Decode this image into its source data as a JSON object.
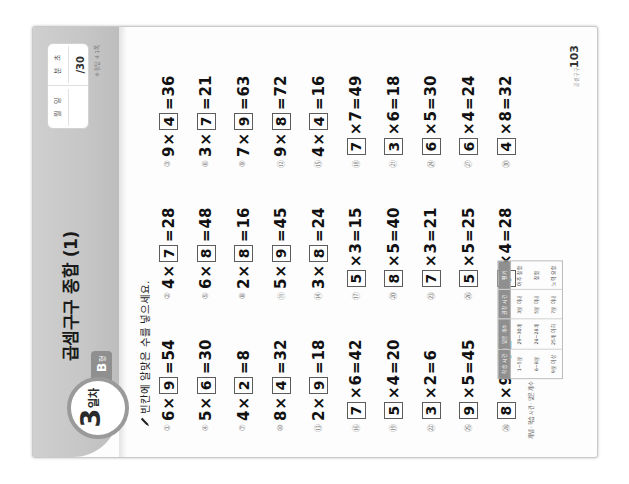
{
  "sheet": {
    "title": "곱셈구구 종합 (1)",
    "day_number": "3",
    "day_unit": "일차",
    "form_letter": "B",
    "form_unit": "형",
    "instruction": "빈칸에 알맞은 수를 넣으세요.",
    "page_number": "103",
    "brand": "곱셈구구",
    "score_box": {
      "label_month": "월",
      "label_day": "일",
      "label_minute": "분",
      "label_second": "초",
      "total": "/30",
      "caption": "※ 정답 4 1쪽"
    },
    "footer_table": {
      "label": "개념 · 학습 시간 · 맞은 개수",
      "headers": [
        "학습 시간",
        "맞은 개수",
        "권장 시간",
        "평가"
      ],
      "rows": [
        [
          "1~5분",
          "29~30개",
          "3분 이내",
          "아주 잘함"
        ],
        [
          "6~8분",
          "26~28개",
          "5분 이내",
          "잘함"
        ],
        [
          "9분 이상",
          "25개 이하",
          "7분 이내",
          "노력 요함"
        ]
      ]
    }
  },
  "problems": [
    {
      "num": "①",
      "a": "6",
      "op": "×",
      "b": "9",
      "eq": "=",
      "result": "54",
      "blank": "b"
    },
    {
      "num": "②",
      "a": "4",
      "op": "×",
      "b": "7",
      "eq": "=",
      "result": "28",
      "blank": "b"
    },
    {
      "num": "③",
      "a": "9",
      "op": "×",
      "b": "4",
      "eq": "=",
      "result": "36",
      "blank": "b"
    },
    {
      "num": "④",
      "a": "5",
      "op": "×",
      "b": "6",
      "eq": "=",
      "result": "30",
      "blank": "b"
    },
    {
      "num": "⑤",
      "a": "6",
      "op": "×",
      "b": "8",
      "eq": "=",
      "result": "48",
      "blank": "b"
    },
    {
      "num": "⑥",
      "a": "3",
      "op": "×",
      "b": "7",
      "eq": "=",
      "result": "21",
      "blank": "b"
    },
    {
      "num": "⑦",
      "a": "4",
      "op": "×",
      "b": "2",
      "eq": "=",
      "result": "8",
      "blank": "b"
    },
    {
      "num": "⑧",
      "a": "2",
      "op": "×",
      "b": "8",
      "eq": "=",
      "result": "16",
      "blank": "b"
    },
    {
      "num": "⑨",
      "a": "7",
      "op": "×",
      "b": "9",
      "eq": "=",
      "result": "63",
      "blank": "b"
    },
    {
      "num": "⑩",
      "a": "8",
      "op": "×",
      "b": "4",
      "eq": "=",
      "result": "32",
      "blank": "b"
    },
    {
      "num": "⑪",
      "a": "5",
      "op": "×",
      "b": "9",
      "eq": "=",
      "result": "45",
      "blank": "b"
    },
    {
      "num": "⑫",
      "a": "9",
      "op": "×",
      "b": "8",
      "eq": "=",
      "result": "72",
      "blank": "b"
    },
    {
      "num": "⑬",
      "a": "2",
      "op": "×",
      "b": "9",
      "eq": "=",
      "result": "18",
      "blank": "b"
    },
    {
      "num": "⑭",
      "a": "3",
      "op": "×",
      "b": "8",
      "eq": "=",
      "result": "24",
      "blank": "b"
    },
    {
      "num": "⑮",
      "a": "4",
      "op": "×",
      "b": "4",
      "eq": "=",
      "result": "16",
      "blank": "b"
    },
    {
      "num": "⑯",
      "a": "7",
      "op": "×",
      "b": "6",
      "eq": "=",
      "result": "42",
      "blank": "a"
    },
    {
      "num": "⑰",
      "a": "5",
      "op": "×",
      "b": "3",
      "eq": "=",
      "result": "15",
      "blank": "a"
    },
    {
      "num": "⑱",
      "a": "7",
      "op": "×",
      "b": "7",
      "eq": "=",
      "result": "49",
      "blank": "a"
    },
    {
      "num": "⑲",
      "a": "5",
      "op": "×",
      "b": "4",
      "eq": "=",
      "result": "20",
      "blank": "a"
    },
    {
      "num": "⑳",
      "a": "8",
      "op": "×",
      "b": "5",
      "eq": "=",
      "result": "40",
      "blank": "a"
    },
    {
      "num": "㉑",
      "a": "3",
      "op": "×",
      "b": "6",
      "eq": "=",
      "result": "18",
      "blank": "a"
    },
    {
      "num": "㉒",
      "a": "3",
      "op": "×",
      "b": "2",
      "eq": "=",
      "result": "6",
      "blank": "a"
    },
    {
      "num": "㉓",
      "a": "7",
      "op": "×",
      "b": "3",
      "eq": "=",
      "result": "21",
      "blank": "a"
    },
    {
      "num": "㉔",
      "a": "6",
      "op": "×",
      "b": "5",
      "eq": "=",
      "result": "30",
      "blank": "a"
    },
    {
      "num": "㉕",
      "a": "9",
      "op": "×",
      "b": "5",
      "eq": "=",
      "result": "45",
      "blank": "a"
    },
    {
      "num": "㉖",
      "a": "5",
      "op": "×",
      "b": "5",
      "eq": "=",
      "result": "25",
      "blank": "a"
    },
    {
      "num": "㉗",
      "a": "6",
      "op": "×",
      "b": "4",
      "eq": "=",
      "result": "24",
      "blank": "a"
    },
    {
      "num": "㉘",
      "a": "8",
      "op": "×",
      "b": "9",
      "eq": "=",
      "result": "72",
      "blank": "a"
    },
    {
      "num": "㉙",
      "a": "7",
      "op": "×",
      "b": "4",
      "eq": "=",
      "result": "28",
      "blank": "a"
    },
    {
      "num": "㉚",
      "a": "4",
      "op": "×",
      "b": "8",
      "eq": "=",
      "result": "32",
      "blank": "a"
    }
  ]
}
